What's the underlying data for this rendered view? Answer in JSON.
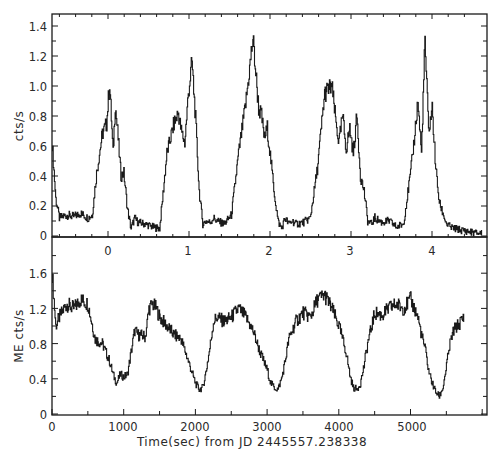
{
  "chart_data": [
    {
      "panel": "top",
      "type": "line",
      "title": "",
      "ylabel": "cts/s",
      "xlabel": "",
      "ylim": [
        0,
        1.48
      ],
      "yticks": [
        0,
        0.2,
        0.4,
        0.6,
        0.8,
        1.0,
        1.2,
        1.4
      ],
      "ytick_labels": [
        "0",
        "0.2",
        "0.4",
        "0.6",
        "0.8",
        "1.0",
        "1.2",
        "1.4"
      ],
      "x_axis_kind": "phase (cycles)",
      "xticks": [
        0,
        1,
        2,
        3,
        4
      ],
      "xtick_labels": [
        "0",
        "1",
        "2",
        "3",
        "4"
      ],
      "xlim_phase": [
        -0.7,
        4.65
      ],
      "grid": false,
      "legend": null,
      "x": [
        0,
        50,
        100,
        200,
        300,
        400,
        500,
        560,
        620,
        700,
        760,
        800,
        850,
        880,
        920,
        960,
        1000,
        1050,
        1100,
        1150,
        1200,
        1300,
        1400,
        1500,
        1600,
        1700,
        1760,
        1800,
        1850,
        1900,
        1950,
        2000,
        2050,
        2100,
        2150,
        2200,
        2250,
        2300,
        2400,
        2500,
        2600,
        2700,
        2800,
        2880,
        2920,
        2960,
        3000,
        3050,
        3100,
        3150,
        3200,
        3250,
        3300,
        3350,
        3400,
        3500,
        3600,
        3700,
        3800,
        3900,
        3960,
        4000,
        4050,
        4100,
        4150,
        4200,
        4250,
        4300,
        4350,
        4400,
        4450,
        4500,
        4600,
        4700,
        4800,
        4900,
        5000,
        5050,
        5100,
        5150,
        5200,
        5250,
        5300,
        5350,
        5400,
        5450,
        5500,
        5550,
        5600,
        5700,
        5800,
        5900,
        6000
      ],
      "values": [
        0.62,
        0.25,
        0.12,
        0.14,
        0.13,
        0.15,
        0.12,
        0.14,
        0.42,
        0.68,
        0.75,
        1.02,
        0.55,
        0.88,
        0.65,
        0.4,
        0.42,
        0.18,
        0.05,
        0.12,
        0.09,
        0.08,
        0.06,
        0.05,
        0.55,
        0.75,
        0.82,
        0.7,
        0.62,
        0.95,
        1.16,
        0.78,
        0.3,
        0.08,
        0.1,
        0.09,
        0.12,
        0.1,
        0.08,
        0.14,
        0.55,
        0.88,
        1.32,
        0.85,
        0.8,
        0.65,
        0.72,
        0.5,
        0.28,
        0.1,
        0.05,
        0.12,
        0.08,
        0.1,
        0.08,
        0.09,
        0.12,
        0.45,
        0.95,
        1.0,
        0.75,
        0.62,
        0.8,
        0.58,
        0.72,
        0.55,
        0.8,
        0.4,
        0.3,
        0.1,
        0.08,
        0.12,
        0.09,
        0.1,
        0.06,
        0.08,
        0.42,
        0.65,
        0.9,
        0.55,
        1.3,
        0.7,
        0.85,
        0.45,
        0.22,
        0.15,
        0.08,
        0.06,
        0.05,
        0.04,
        0.03,
        0.02,
        0.02
      ]
    },
    {
      "panel": "bottom",
      "type": "line",
      "title": "",
      "ylabel": "ME cts/s",
      "xlabel": "Time(sec) from JD 2445557.238338",
      "ylim": [
        0,
        1.8
      ],
      "yticks": [
        0,
        0.4,
        0.8,
        1.2,
        1.6
      ],
      "ytick_labels": [
        "0",
        "0.4",
        "0.8",
        "1.2",
        "1.6"
      ],
      "xlim": [
        0,
        6040
      ],
      "xticks": [
        0,
        1000,
        2000,
        3000,
        4000,
        5000
      ],
      "xtick_labels": [
        "0",
        "1000",
        "2000",
        "3000",
        "4000",
        "5000"
      ],
      "grid": false,
      "legend": null,
      "x": [
        0,
        50,
        100,
        200,
        300,
        400,
        500,
        550,
        600,
        700,
        800,
        850,
        900,
        950,
        1000,
        1050,
        1100,
        1150,
        1200,
        1300,
        1350,
        1400,
        1450,
        1500,
        1600,
        1700,
        1800,
        1900,
        2000,
        2050,
        2100,
        2150,
        2200,
        2250,
        2300,
        2400,
        2500,
        2600,
        2700,
        2800,
        2900,
        3000,
        3050,
        3100,
        3150,
        3200,
        3250,
        3300,
        3400,
        3500,
        3600,
        3700,
        3800,
        3900,
        4000,
        4100,
        4150,
        4200,
        4250,
        4300,
        4350,
        4400,
        4500,
        4600,
        4700,
        4800,
        4900,
        5000,
        5100,
        5150,
        5200,
        5250,
        5300,
        5350,
        5400,
        5450,
        5500,
        5550,
        5600,
        5700,
        5750
      ],
      "values": [
        1.6,
        1.0,
        1.1,
        1.25,
        1.2,
        1.3,
        1.25,
        1.05,
        0.85,
        0.8,
        0.6,
        0.45,
        0.35,
        0.45,
        0.42,
        0.45,
        0.7,
        0.95,
        0.9,
        0.88,
        1.2,
        1.25,
        1.2,
        1.1,
        1.0,
        0.9,
        0.85,
        0.6,
        0.35,
        0.28,
        0.3,
        0.5,
        0.75,
        1.05,
        1.1,
        1.05,
        1.1,
        1.2,
        1.1,
        0.95,
        0.7,
        0.5,
        0.35,
        0.3,
        0.28,
        0.4,
        0.6,
        0.85,
        1.05,
        1.15,
        1.1,
        1.3,
        1.35,
        1.2,
        1.0,
        0.7,
        0.45,
        0.3,
        0.28,
        0.35,
        0.55,
        0.8,
        1.15,
        1.12,
        1.2,
        1.25,
        1.2,
        1.3,
        1.1,
        0.9,
        0.75,
        0.5,
        0.35,
        0.25,
        0.2,
        0.3,
        0.55,
        0.8,
        0.95,
        1.05,
        1.1
      ]
    }
  ],
  "labels": {
    "top_ylabel": "cts/s",
    "bottom_ylabel": "ME cts/s",
    "xlabel": "Time(sec) from JD 2445557.238338",
    "top_yticks": [
      "0",
      "0.2",
      "0.4",
      "0.6",
      "0.8",
      "1.0",
      "1.2",
      "1.4"
    ],
    "bottom_yticks": [
      "0",
      "0.4",
      "0.8",
      "1.2",
      "1.6"
    ],
    "phase_ticks": [
      "0",
      "1",
      "2",
      "3",
      "4"
    ],
    "time_ticks": [
      "0",
      "1000",
      "2000",
      "3000",
      "4000",
      "5000"
    ]
  },
  "colors": {
    "ink": "#1a1a1a",
    "background": "#ffffff"
  }
}
